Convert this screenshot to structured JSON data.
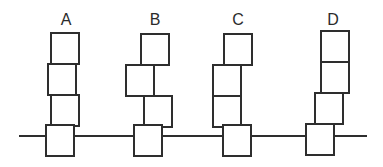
{
  "diagram": {
    "type": "stacked-blocks-comparison",
    "baseline": {
      "x1": 19,
      "x2": 367,
      "y": 136
    },
    "stroke_color": "#2e2e2e",
    "block_size": {
      "w": 28,
      "h": 31
    },
    "stacks": [
      {
        "label": "A",
        "label_x": 66,
        "blocks": [
          {
            "x": 51,
            "y": 33
          },
          {
            "x": 48,
            "y": 64
          },
          {
            "x": 51,
            "y": 95
          },
          {
            "x": 46,
            "y": 125
          }
        ]
      },
      {
        "label": "B",
        "label_x": 155,
        "blocks": [
          {
            "x": 141,
            "y": 34
          },
          {
            "x": 126,
            "y": 65
          },
          {
            "x": 144,
            "y": 96
          },
          {
            "x": 134,
            "y": 125
          }
        ]
      },
      {
        "label": "C",
        "label_x": 238,
        "blocks": [
          {
            "x": 224,
            "y": 34
          },
          {
            "x": 213,
            "y": 65
          },
          {
            "x": 213,
            "y": 96
          },
          {
            "x": 223,
            "y": 125
          }
        ]
      },
      {
        "label": "D",
        "label_x": 333,
        "blocks": [
          {
            "x": 321,
            "y": 31
          },
          {
            "x": 321,
            "y": 62
          },
          {
            "x": 315,
            "y": 93
          },
          {
            "x": 306,
            "y": 124
          }
        ]
      }
    ]
  }
}
